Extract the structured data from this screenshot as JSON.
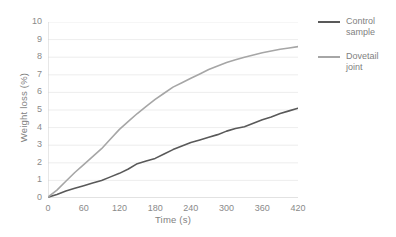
{
  "chart_data": {
    "type": "line",
    "title": "",
    "xlabel": "Time (s)",
    "ylabel": "Weight loss (%)",
    "xlim": [
      0,
      420
    ],
    "ylim": [
      0,
      10
    ],
    "xticks": [
      0,
      60,
      120,
      180,
      240,
      300,
      360,
      420
    ],
    "yticks": [
      0,
      1,
      2,
      3,
      4,
      5,
      6,
      7,
      8,
      9,
      10
    ],
    "grid": "horizontal",
    "legend_position": "right",
    "x": [
      0,
      15,
      30,
      45,
      60,
      75,
      90,
      105,
      120,
      135,
      150,
      165,
      180,
      195,
      210,
      225,
      240,
      255,
      270,
      285,
      300,
      315,
      330,
      345,
      360,
      375,
      390,
      405,
      420
    ],
    "series": [
      {
        "name": "Control sample",
        "color": "#595959",
        "values": [
          0.05,
          0.2,
          0.4,
          0.55,
          0.7,
          0.85,
          1.0,
          1.2,
          1.4,
          1.65,
          1.95,
          2.1,
          2.25,
          2.5,
          2.75,
          2.95,
          3.15,
          3.3,
          3.45,
          3.6,
          3.8,
          3.95,
          4.05,
          4.25,
          4.45,
          4.6,
          4.8,
          4.95,
          5.1
        ]
      },
      {
        "name": "Dovetail joint",
        "color": "#a6a6a6",
        "values": [
          0.05,
          0.45,
          0.95,
          1.45,
          1.9,
          2.35,
          2.8,
          3.35,
          3.9,
          4.35,
          4.8,
          5.2,
          5.6,
          5.95,
          6.3,
          6.55,
          6.8,
          7.05,
          7.3,
          7.5,
          7.7,
          7.85,
          8.0,
          8.12,
          8.25,
          8.35,
          8.45,
          8.52,
          8.6
        ]
      }
    ]
  },
  "legend": {
    "items": [
      {
        "label_line1": "Control",
        "label_line2": "sample"
      },
      {
        "label_line1": "Dovetail",
        "label_line2": "joint"
      }
    ]
  }
}
